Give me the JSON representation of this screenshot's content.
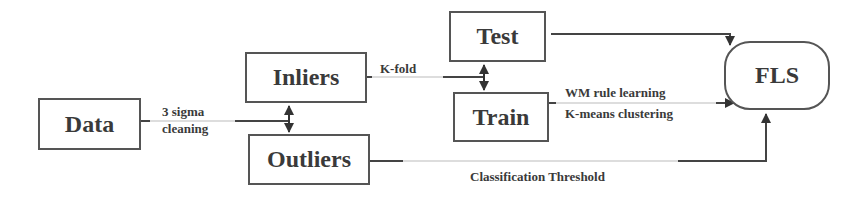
{
  "diagram": {
    "nodes": {
      "data": "Data",
      "inliers": "Inliers",
      "outliers": "Outliers",
      "test": "Test",
      "train": "Train",
      "fls": "FLS"
    },
    "edge_labels": {
      "sigma_line1": "3 sigma",
      "sigma_line2": "cleaning",
      "kfold": "K-fold",
      "wm_rule": "WM rule learning",
      "kmeans": "K-means clustering",
      "classification": "Classification Threshold"
    },
    "edges": [
      {
        "from": "Data",
        "to": "Inliers/Outliers",
        "label": "3 sigma cleaning"
      },
      {
        "from": "Inliers",
        "to": "Test/Train",
        "label": "K-fold"
      },
      {
        "from": "Test",
        "to": "FLS",
        "label": ""
      },
      {
        "from": "Train",
        "to": "FLS",
        "label": "WM rule learning, K-means clustering"
      },
      {
        "from": "Outliers",
        "to": "FLS",
        "label": "Classification Threshold"
      }
    ]
  }
}
